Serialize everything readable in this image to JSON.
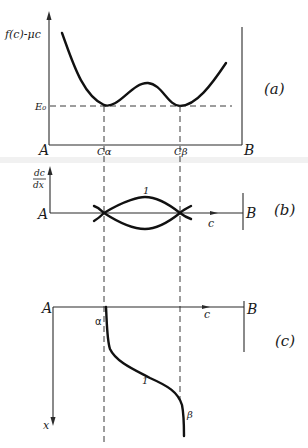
{
  "figure": {
    "panels": [
      {
        "id": "a",
        "tag": "(a)",
        "y_axis_label": "f(c)-μc",
        "level_label": "E₀",
        "left_label": "A",
        "right_label": "B",
        "tick_labels": [
          "Cα",
          "Cβ"
        ],
        "curve": "double-well free energy with two minima at Cα and Cβ touching tangent line E₀"
      },
      {
        "id": "b",
        "tag": "(b)",
        "y_axis_label_num": "dc",
        "y_axis_label_den": "dx",
        "left_label": "A",
        "right_label": "B",
        "x_axis_label": "c",
        "curve_label": "1",
        "curve": "lens-shaped phase trajectories crossing axis at Cα and Cβ"
      },
      {
        "id": "c",
        "tag": "(c)",
        "left_label": "A",
        "right_label": "B",
        "x_axis_label": "c",
        "vertical_axis_label": "x",
        "curve_label": "1",
        "start_label": "α",
        "end_label": "β",
        "curve": "concentration profile c(x) transitioning from α to β"
      }
    ],
    "colors": {
      "ink": "#111111",
      "background": "#ffffff"
    }
  }
}
